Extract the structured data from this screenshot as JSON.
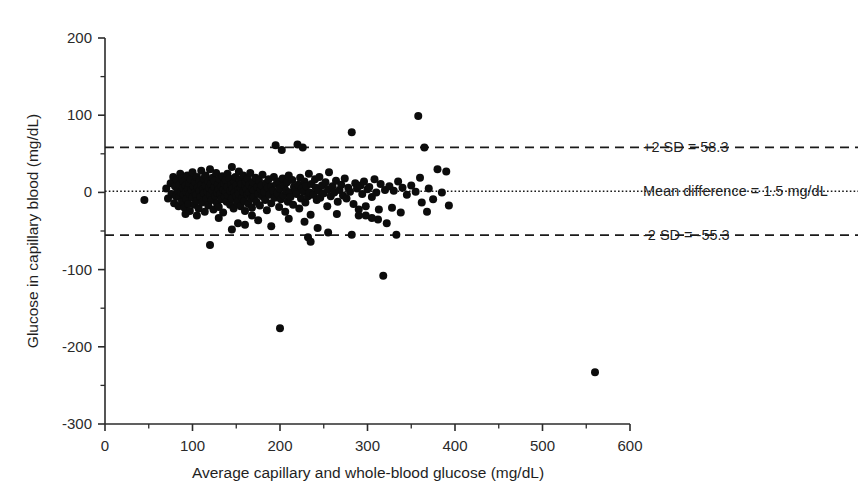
{
  "chart_data": {
    "type": "scatter",
    "title": "",
    "xlabel": "Average capillary and whole-blood glucose (mg/dL)",
    "ylabel": "Glucose in capillary blood (mg/dL)",
    "xlim": [
      0,
      600
    ],
    "ylim": [
      -300,
      200
    ],
    "xticks": [
      0,
      100,
      200,
      300,
      400,
      500,
      600
    ],
    "yticks": [
      200,
      100,
      0,
      -100,
      -200,
      -300
    ],
    "xtick_labels": [
      "0",
      "100",
      "200",
      "300",
      "400",
      "500",
      "600"
    ],
    "ytick_labels": [
      "200",
      "100",
      "0",
      "-100",
      "-200",
      "-300"
    ],
    "minor_tick_step_x": 50,
    "minor_tick_step_y": 50,
    "grid": false,
    "legend": "none",
    "plot_kind": "bland-altman",
    "reference_lines": [
      {
        "name": "upper-limit-of-agreement",
        "value": 58.3,
        "style": "dashed",
        "label": "+2 SD = 58.3"
      },
      {
        "name": "mean-difference",
        "value": 1.5,
        "style": "dotted",
        "label": "Mean difference = 1.5 mg/dL"
      },
      {
        "name": "lower-limit-of-agreement",
        "value": -55.3,
        "style": "dashed",
        "label": "-2 SD = -55.3"
      }
    ],
    "annotations": [
      {
        "text": "+2 SD = 58.3",
        "y": 58.3
      },
      {
        "text": "Mean difference = 1.5 mg/dL",
        "y": 1.5
      },
      {
        "text": "-2 SD = -55.3",
        "y": -55.3
      }
    ],
    "marker": {
      "shape": "circle",
      "color": "#0c0c0c",
      "size_px": 5.2
    },
    "n_points": 262,
    "points": [
      [
        45,
        -10
      ],
      [
        70,
        5
      ],
      [
        72,
        -8
      ],
      [
        75,
        12
      ],
      [
        76,
        -2
      ],
      [
        78,
        20
      ],
      [
        79,
        -14
      ],
      [
        80,
        8
      ],
      [
        81,
        -5
      ],
      [
        82,
        16
      ],
      [
        83,
        2
      ],
      [
        84,
        -18
      ],
      [
        85,
        10
      ],
      [
        85,
        -6
      ],
      [
        86,
        24
      ],
      [
        87,
        0
      ],
      [
        88,
        -12
      ],
      [
        88,
        18
      ],
      [
        89,
        6
      ],
      [
        90,
        -3
      ],
      [
        90,
        14
      ],
      [
        91,
        -20
      ],
      [
        92,
        9
      ],
      [
        93,
        1
      ],
      [
        93,
        -9
      ],
      [
        94,
        22
      ],
      [
        95,
        -15
      ],
      [
        95,
        5
      ],
      [
        96,
        12
      ],
      [
        97,
        -2
      ],
      [
        97,
        -24
      ],
      [
        98,
        17
      ],
      [
        99,
        3
      ],
      [
        100,
        -7
      ],
      [
        100,
        26
      ],
      [
        101,
        8
      ],
      [
        102,
        -16
      ],
      [
        103,
        0
      ],
      [
        103,
        13
      ],
      [
        104,
        -4
      ],
      [
        105,
        20
      ],
      [
        105,
        -11
      ],
      [
        106,
        6
      ],
      [
        107,
        -21
      ],
      [
        108,
        15
      ],
      [
        108,
        2
      ],
      [
        109,
        -6
      ],
      [
        110,
        28
      ],
      [
        110,
        10
      ],
      [
        111,
        -13
      ],
      [
        112,
        4
      ],
      [
        113,
        -1
      ],
      [
        113,
        18
      ],
      [
        114,
        -25
      ],
      [
        115,
        9
      ],
      [
        115,
        22
      ],
      [
        116,
        -8
      ],
      [
        117,
        1
      ],
      [
        118,
        14
      ],
      [
        118,
        -17
      ],
      [
        119,
        6
      ],
      [
        120,
        -3
      ],
      [
        120,
        30
      ],
      [
        121,
        11
      ],
      [
        122,
        -10
      ],
      [
        123,
        2
      ],
      [
        123,
        19
      ],
      [
        124,
        -22
      ],
      [
        125,
        7
      ],
      [
        125,
        15
      ],
      [
        126,
        -5
      ],
      [
        127,
        25
      ],
      [
        128,
        0
      ],
      [
        128,
        -14
      ],
      [
        129,
        10
      ],
      [
        130,
        4
      ],
      [
        130,
        -19
      ],
      [
        131,
        17
      ],
      [
        132,
        -2
      ],
      [
        133,
        8
      ],
      [
        133,
        -9
      ],
      [
        134,
        21
      ],
      [
        135,
        -26
      ],
      [
        135,
        3
      ],
      [
        136,
        12
      ],
      [
        137,
        -6
      ],
      [
        138,
        1
      ],
      [
        138,
        16
      ],
      [
        139,
        -12
      ],
      [
        140,
        24
      ],
      [
        140,
        7
      ],
      [
        141,
        -4
      ],
      [
        142,
        18
      ],
      [
        143,
        -16
      ],
      [
        143,
        2
      ],
      [
        144,
        10
      ],
      [
        145,
        -8
      ],
      [
        145,
        33
      ],
      [
        146,
        5
      ],
      [
        147,
        -21
      ],
      [
        148,
        14
      ],
      [
        148,
        0
      ],
      [
        149,
        20
      ],
      [
        150,
        -5
      ],
      [
        150,
        9
      ],
      [
        151,
        -13
      ],
      [
        152,
        3
      ],
      [
        153,
        27
      ],
      [
        153,
        -2
      ],
      [
        154,
        16
      ],
      [
        155,
        -18
      ],
      [
        155,
        6
      ],
      [
        156,
        11
      ],
      [
        157,
        -7
      ],
      [
        158,
        1
      ],
      [
        158,
        22
      ],
      [
        159,
        -11
      ],
      [
        160,
        8
      ],
      [
        160,
        -24
      ],
      [
        161,
        14
      ],
      [
        162,
        4
      ],
      [
        163,
        -3
      ],
      [
        163,
        18
      ],
      [
        164,
        -15
      ],
      [
        165,
        10
      ],
      [
        165,
        0
      ],
      [
        166,
        25
      ],
      [
        167,
        -8
      ],
      [
        168,
        5
      ],
      [
        168,
        -20
      ],
      [
        169,
        13
      ],
      [
        170,
        2
      ],
      [
        170,
        -6
      ],
      [
        172,
        19
      ],
      [
        173,
        -12
      ],
      [
        174,
        7
      ],
      [
        175,
        -2
      ],
      [
        176,
        15
      ],
      [
        177,
        -17
      ],
      [
        178,
        4
      ],
      [
        179,
        9
      ],
      [
        180,
        -5
      ],
      [
        180,
        23
      ],
      [
        182,
        1
      ],
      [
        183,
        -10
      ],
      [
        184,
        12
      ],
      [
        185,
        -23
      ],
      [
        186,
        6
      ],
      [
        187,
        17
      ],
      [
        188,
        -3
      ],
      [
        190,
        8
      ],
      [
        190,
        -14
      ],
      [
        192,
        2
      ],
      [
        193,
        20
      ],
      [
        194,
        -7
      ],
      [
        195,
        61
      ],
      [
        196,
        11
      ],
      [
        197,
        -1
      ],
      [
        198,
        14
      ],
      [
        199,
        -19
      ],
      [
        200,
        5
      ],
      [
        201,
        -9
      ],
      [
        202,
        55
      ],
      [
        203,
        18
      ],
      [
        204,
        -4
      ],
      [
        205,
        9
      ],
      [
        206,
        -25
      ],
      [
        207,
        2
      ],
      [
        208,
        13
      ],
      [
        209,
        -12
      ],
      [
        210,
        22
      ],
      [
        211,
        0
      ],
      [
        212,
        -6
      ],
      [
        214,
        16
      ],
      [
        215,
        -16
      ],
      [
        216,
        7
      ],
      [
        218,
        3
      ],
      [
        219,
        -2
      ],
      [
        220,
        62
      ],
      [
        221,
        10
      ],
      [
        222,
        -21
      ],
      [
        223,
        19
      ],
      [
        224,
        -8
      ],
      [
        225,
        5
      ],
      [
        226,
        58
      ],
      [
        227,
        1
      ],
      [
        228,
        14
      ],
      [
        229,
        -13
      ],
      [
        230,
        8
      ],
      [
        232,
        -5
      ],
      [
        233,
        24
      ],
      [
        234,
        0
      ],
      [
        235,
        -29
      ],
      [
        236,
        11
      ],
      [
        238,
        -3
      ],
      [
        240,
        17
      ],
      [
        241,
        6
      ],
      [
        242,
        -10
      ],
      [
        244,
        2
      ],
      [
        245,
        20
      ],
      [
        246,
        -7
      ],
      [
        248,
        9
      ],
      [
        250,
        -1
      ],
      [
        252,
        13
      ],
      [
        254,
        -18
      ],
      [
        255,
        4
      ],
      [
        256,
        26
      ],
      [
        258,
        -5
      ],
      [
        260,
        8
      ],
      [
        262,
        0
      ],
      [
        264,
        15
      ],
      [
        266,
        -12
      ],
      [
        268,
        3
      ],
      [
        270,
        10
      ],
      [
        272,
        -4
      ],
      [
        274,
        18
      ],
      [
        276,
        -8
      ],
      [
        278,
        6
      ],
      [
        280,
        1
      ],
      [
        282,
        78
      ],
      [
        284,
        -15
      ],
      [
        286,
        12
      ],
      [
        288,
        5
      ],
      [
        290,
        -22
      ],
      [
        292,
        9
      ],
      [
        294,
        -2
      ],
      [
        296,
        14
      ],
      [
        298,
        -30
      ],
      [
        300,
        4
      ],
      [
        302,
        7
      ],
      [
        305,
        -6
      ],
      [
        308,
        17
      ],
      [
        310,
        0
      ],
      [
        312,
        -35
      ],
      [
        315,
        11
      ],
      [
        318,
        -108
      ],
      [
        320,
        3
      ],
      [
        322,
        -40
      ],
      [
        325,
        8
      ],
      [
        328,
        -20
      ],
      [
        330,
        2
      ],
      [
        333,
        -55
      ],
      [
        335,
        14
      ],
      [
        340,
        6
      ],
      [
        345,
        -3
      ],
      [
        350,
        9
      ],
      [
        355,
        1
      ],
      [
        358,
        99
      ],
      [
        360,
        19
      ],
      [
        362,
        -13
      ],
      [
        365,
        58
      ],
      [
        368,
        -25
      ],
      [
        370,
        5
      ],
      [
        375,
        -9
      ],
      [
        380,
        30
      ],
      [
        385,
        0
      ],
      [
        390,
        27
      ],
      [
        393,
        -17
      ],
      [
        200,
        -176
      ],
      [
        232,
        -58
      ],
      [
        282,
        -55
      ],
      [
        290,
        -30
      ],
      [
        305,
        -33
      ],
      [
        228,
        -38
      ],
      [
        235,
        -64
      ],
      [
        560,
        -233
      ],
      [
        120,
        -68
      ],
      [
        160,
        -42
      ],
      [
        175,
        -36
      ],
      [
        145,
        -48
      ],
      [
        265,
        -28
      ],
      [
        168,
        -30
      ],
      [
        190,
        -44
      ],
      [
        210,
        -34
      ],
      [
        243,
        -46
      ],
      [
        255,
        -52
      ],
      [
        298,
        -18
      ],
      [
        313,
        -22
      ],
      [
        338,
        -26
      ],
      [
        130,
        -33
      ],
      [
        152,
        -40
      ],
      [
        105,
        -30
      ],
      [
        92,
        -28
      ]
    ]
  },
  "axis": {
    "x_title": "Average capillary and whole-blood glucose (mg/dL)",
    "y_title": "Glucose in capillary blood (mg/dL)"
  },
  "colors": {
    "background": "#ffffff",
    "axis": "#2b2b2b",
    "marker": "#0c0c0c",
    "text": "#1f1f1f"
  }
}
